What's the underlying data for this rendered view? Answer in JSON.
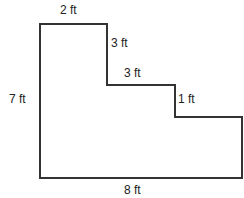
{
  "diagram": {
    "type": "composite-shape",
    "stroke_color": "#333333",
    "vertices": [
      [
        40,
        24
      ],
      [
        107,
        24
      ],
      [
        107,
        85
      ],
      [
        175,
        85
      ],
      [
        175,
        117
      ],
      [
        242,
        117
      ],
      [
        242,
        178
      ],
      [
        40,
        178
      ]
    ],
    "labels": {
      "top": "2 ft",
      "upper_step_vertical": "3 ft",
      "middle_step_horizontal": "3 ft",
      "lower_step_vertical": "1 ft",
      "left": "7 ft",
      "bottom": "8 ft"
    }
  }
}
